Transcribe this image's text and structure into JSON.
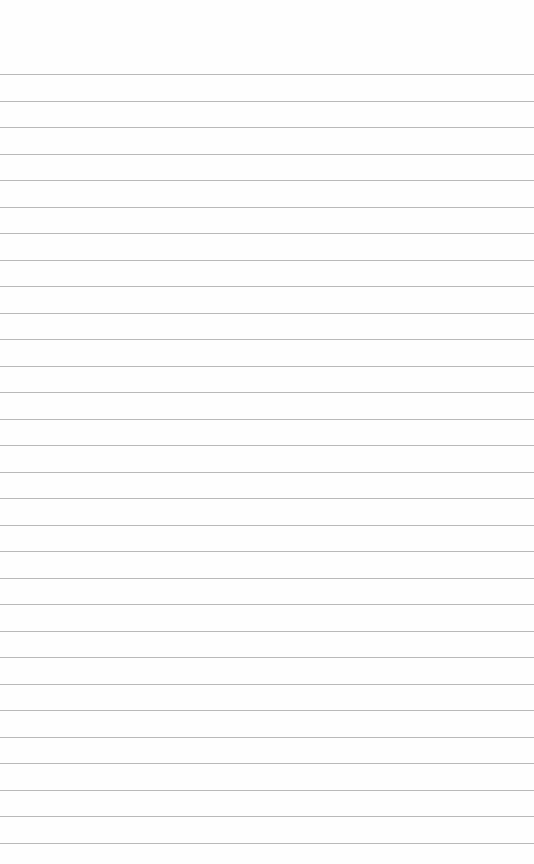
{
  "page": {
    "type": "ruled-paper",
    "background_color": "#fefefe",
    "line_color": "#b9b9b9",
    "first_line_y": 74,
    "line_spacing": 26.5,
    "line_count": 30
  }
}
